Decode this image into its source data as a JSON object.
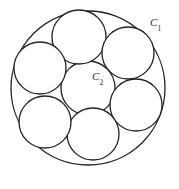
{
  "figure": {
    "background_color": "#ffffff",
    "stroke_color": "#222222",
    "fill_color": "#ffffff",
    "canvas": {
      "width": 179,
      "height": 189
    }
  },
  "labels": {
    "outer_circle": {
      "base": "C",
      "subscript": "1",
      "x": 150,
      "y": 17
    },
    "center_circle": {
      "base": "C",
      "subscript": "2",
      "x": 92,
      "y": 71
    }
  },
  "chart_data": {
    "type": "diagram",
    "outer_circle": {
      "label": "C1",
      "cx": 88,
      "cy": 88,
      "r": 77
    },
    "inner_radius": 27,
    "ring_distance": 52,
    "inner_circles": [
      {
        "label": "C2",
        "role": "center",
        "cx": 88,
        "cy": 88,
        "r": 27,
        "angle_deg": null
      },
      {
        "label": "",
        "role": "ring",
        "cx": 79,
        "cy": 37,
        "r": 27,
        "angle_deg": 100
      },
      {
        "label": "",
        "role": "ring",
        "cx": 128,
        "cy": 53,
        "r": 26,
        "angle_deg": 40
      },
      {
        "label": "",
        "role": "ring",
        "cx": 136,
        "cy": 105,
        "r": 26,
        "angle_deg": -20
      },
      {
        "label": "",
        "role": "ring",
        "cx": 93,
        "cy": 134,
        "r": 26,
        "angle_deg": -80
      },
      {
        "label": "",
        "role": "ring",
        "cx": 45,
        "cy": 122,
        "r": 26,
        "angle_deg": -140
      },
      {
        "label": "",
        "role": "ring",
        "cx": 40,
        "cy": 68,
        "r": 26,
        "angle_deg": 160
      }
    ]
  }
}
